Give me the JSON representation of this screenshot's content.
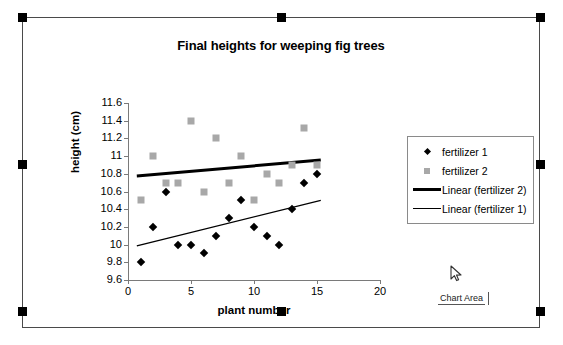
{
  "window": {
    "selection_handles": 8,
    "frame_border_color": "#4a4a4a"
  },
  "tooltip": {
    "label": "Chart Area"
  },
  "cursor": {
    "icon": "arrow-pointer"
  },
  "legend": {
    "entries": [
      {
        "label": "fertilizer 1",
        "key": "diamond-marker",
        "color": "#000000"
      },
      {
        "label": "fertilizer 2",
        "key": "square-marker",
        "color": "#a8a8a8"
      },
      {
        "label": "Linear (fertilizer 2)",
        "key": "thick-line",
        "color": "#000000"
      },
      {
        "label": "Linear (fertilizer 1)",
        "key": "thin-line",
        "color": "#000000"
      }
    ]
  },
  "chart_data": {
    "type": "scatter",
    "title": "Final heights for weeping fig trees",
    "xlabel": "plant number",
    "ylabel": "height (cm)",
    "xlim": [
      0,
      20
    ],
    "ylim": [
      9.6,
      11.6
    ],
    "xticks": [
      0,
      5,
      10,
      15,
      20
    ],
    "yticks": [
      9.6,
      9.8,
      10,
      10.2,
      10.4,
      10.6,
      10.8,
      11,
      11.2,
      11.4,
      11.6
    ],
    "ytick_labels": [
      "9.6",
      "9.8",
      "10",
      "10.2",
      "10.4",
      "10.6",
      "10.8",
      "11",
      "11.2",
      "11.4",
      "11.6"
    ],
    "xtick_labels": [
      "0",
      "5",
      "10",
      "15",
      "20"
    ],
    "grid": false,
    "legend_position": "right",
    "series": [
      {
        "name": "fertilizer 1",
        "marker": "diamond",
        "color": "#000000",
        "x": [
          1,
          2,
          3,
          4,
          5,
          6,
          7,
          8,
          9,
          10,
          11,
          12,
          13,
          14,
          15
        ],
        "y": [
          9.8,
          10.2,
          10.6,
          10.0,
          10.0,
          9.9,
          10.1,
          10.3,
          10.5,
          10.2,
          10.1,
          10.0,
          10.4,
          10.7,
          10.8
        ]
      },
      {
        "name": "fertilizer 2",
        "marker": "square",
        "color": "#a8a8a8",
        "x": [
          1,
          2,
          3,
          4,
          5,
          6,
          7,
          8,
          9,
          10,
          11,
          12,
          13,
          14,
          15
        ],
        "y": [
          10.5,
          11.0,
          10.7,
          10.7,
          11.4,
          10.6,
          11.2,
          10.7,
          11.0,
          10.5,
          10.8,
          10.7,
          10.9,
          11.32,
          10.9
        ]
      }
    ],
    "trendlines": [
      {
        "name": "Linear (fertilizer 2)",
        "style": "thick",
        "color": "#000000",
        "x0": 0.7,
        "y0": 10.775,
        "x1": 15.3,
        "y1": 10.955
      },
      {
        "name": "Linear (fertilizer 1)",
        "style": "thin",
        "color": "#000000",
        "x0": 0.7,
        "y0": 9.985,
        "x1": 15.3,
        "y1": 10.5
      }
    ]
  }
}
